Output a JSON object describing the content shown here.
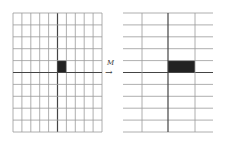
{
  "diagram": {
    "transform_label": "M",
    "arrow_glyph": "→",
    "left_grid": {
      "x": 13,
      "y": 13,
      "width": 89,
      "height": 119,
      "cols": 10,
      "rows": 10,
      "axis_col": 5,
      "axis_row": 5,
      "filled_cell": {
        "col": 5,
        "row": 4
      }
    },
    "right_grid": {
      "x": 123,
      "y": 13,
      "width": 90,
      "height": 119,
      "v_lines": [
        142,
        168,
        195
      ],
      "rows": 10,
      "axis_x": 168,
      "axis_row": 5,
      "filled_cell": {
        "x1": 168,
        "x2": 195,
        "row": 4
      }
    },
    "colors": {
      "line": "#9a9a9a",
      "axis": "#444444",
      "fill": "#222222"
    }
  }
}
